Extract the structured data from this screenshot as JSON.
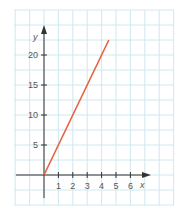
{
  "chart_data": {
    "type": "line",
    "title": "",
    "xlabel": "x",
    "ylabel": "y",
    "xlim": [
      -2,
      7.5
    ],
    "ylim": [
      -4,
      28
    ],
    "grid": true,
    "x_ticks": [
      1,
      2,
      3,
      4,
      5,
      6
    ],
    "x_tick_labels": [
      "1",
      "2",
      "3",
      "4",
      "5",
      "6"
    ],
    "y_ticks": [
      5,
      10,
      15,
      20
    ],
    "y_tick_labels": [
      "5",
      "10",
      "15",
      "20"
    ],
    "series": [
      {
        "name": "y = 5x",
        "color": "#e8603c",
        "x": [
          0,
          4.5
        ],
        "y": [
          0,
          22.5
        ]
      }
    ]
  },
  "colors": {
    "grid": "#cfe8f0",
    "axis": "#333333",
    "line": "#e8603c"
  }
}
